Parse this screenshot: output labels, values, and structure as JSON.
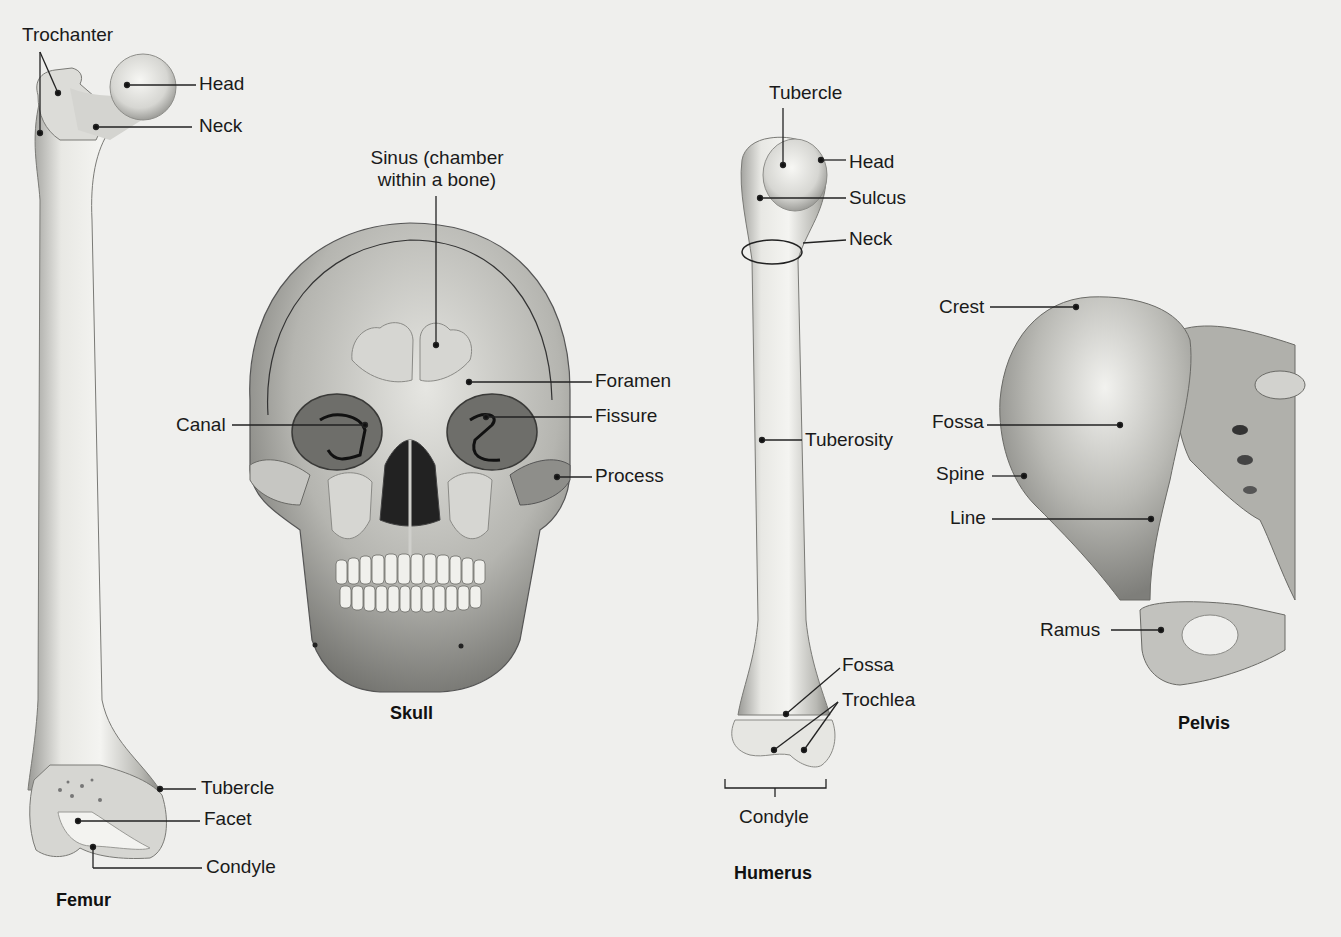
{
  "figure": {
    "background": "#efefed",
    "bones": [
      {
        "id": "femur",
        "title": "Femur",
        "title_pos": [
          56,
          890
        ],
        "labels": [
          {
            "text": "Trochanter",
            "pos": [
              22,
              24
            ]
          },
          {
            "text": "Head",
            "pos": [
              199,
              73
            ]
          },
          {
            "text": "Neck",
            "pos": [
              199,
              115
            ]
          },
          {
            "text": "Tubercle",
            "pos": [
              201,
              777
            ]
          },
          {
            "text": "Facet",
            "pos": [
              204,
              808
            ]
          },
          {
            "text": "Condyle",
            "pos": [
              206,
              856
            ]
          }
        ]
      },
      {
        "id": "skull",
        "title": "Skull",
        "title_pos": [
          390,
          703
        ],
        "labels": [
          {
            "text": "Sinus (chamber\nwithin a bone)",
            "pos": [
              364,
              147
            ],
            "multiline": [
              "Sinus (chamber",
              "within a bone)"
            ]
          },
          {
            "text": "Foramen",
            "pos": [
              595,
              370
            ]
          },
          {
            "text": "Canal",
            "pos": [
              176,
              414
            ]
          },
          {
            "text": "Fissure",
            "pos": [
              595,
              405
            ]
          },
          {
            "text": "Process",
            "pos": [
              595,
              465
            ]
          }
        ]
      },
      {
        "id": "humerus",
        "title": "Humerus",
        "title_pos": [
          734,
          863
        ],
        "labels": [
          {
            "text": "Tubercle",
            "pos": [
              769,
              82
            ]
          },
          {
            "text": "Head",
            "pos": [
              849,
              151
            ]
          },
          {
            "text": "Sulcus",
            "pos": [
              849,
              187
            ]
          },
          {
            "text": "Neck",
            "pos": [
              849,
              228
            ]
          },
          {
            "text": "Tuberosity",
            "pos": [
              805,
              429
            ]
          },
          {
            "text": "Fossa",
            "pos": [
              842,
              654
            ]
          },
          {
            "text": "Trochlea",
            "pos": [
              842,
              689
            ]
          },
          {
            "text": "Condyle",
            "pos": [
              739,
              806
            ]
          }
        ]
      },
      {
        "id": "pelvis",
        "title": "Pelvis",
        "title_pos": [
          1178,
          713
        ],
        "labels": [
          {
            "text": "Crest",
            "pos": [
              939,
              296
            ]
          },
          {
            "text": "Fossa",
            "pos": [
              932,
              411
            ]
          },
          {
            "text": "Spine",
            "pos": [
              936,
              463
            ]
          },
          {
            "text": "Line",
            "pos": [
              950,
              507
            ]
          },
          {
            "text": "Ramus",
            "pos": [
              1040,
              619
            ]
          }
        ]
      }
    ]
  }
}
